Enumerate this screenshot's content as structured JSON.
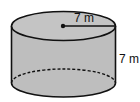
{
  "diagram": {
    "shape": "cylinder",
    "radius_label": "7 m",
    "height_label": "7 m",
    "colors": {
      "fill": "#bebebe",
      "top_fill": "#c4c4c4",
      "stroke": "#111111"
    }
  }
}
